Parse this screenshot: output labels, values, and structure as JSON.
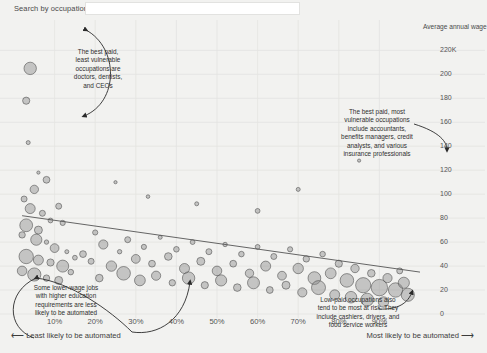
{
  "search": {
    "label": "Search by occupation:",
    "value": "",
    "placeholder": ""
  },
  "chart_data": {
    "type": "scatter",
    "title": "",
    "xlabel": "",
    "ylabel": "Average annual wage",
    "xtick_labels": [
      "10%",
      "20%",
      "30%",
      "40%",
      "50%",
      "60%",
      "70%",
      "80%",
      "90%"
    ],
    "xtick_values": [
      10,
      20,
      30,
      40,
      50,
      60,
      70,
      80,
      90
    ],
    "ytick_labels": [
      "220K",
      "200",
      "180",
      "160",
      "140",
      "120",
      "100",
      "80",
      "60",
      "40",
      "20",
      "0"
    ],
    "ytick_values": [
      220,
      200,
      180,
      160,
      140,
      120,
      100,
      80,
      60,
      40,
      20,
      0
    ],
    "xlim": [
      0,
      100
    ],
    "ylim": [
      0,
      232
    ],
    "grid": true,
    "legend": "none",
    "bubble_size_meaning": "number of workers in occupation",
    "trendline": {
      "present": true,
      "x0": 2,
      "y0": 82,
      "x1": 100,
      "y1": 35,
      "description": "downward sloping fit: higher automation risk associates with lower wage"
    },
    "axis_note_left": "Least likely to be automated",
    "axis_note_right": "Most likely to be automated",
    "points": [
      {
        "x": 4,
        "y": 205,
        "r": 6.2
      },
      {
        "x": 3,
        "y": 178,
        "r": 3.6
      },
      {
        "x": 3.5,
        "y": 143,
        "r": 2.0
      },
      {
        "x": 6,
        "y": 118,
        "r": 1.6
      },
      {
        "x": 2.5,
        "y": 96,
        "r": 3.0
      },
      {
        "x": 5,
        "y": 104,
        "r": 4.2
      },
      {
        "x": 8,
        "y": 112,
        "r": 3.4
      },
      {
        "x": 4,
        "y": 88,
        "r": 5.0
      },
      {
        "x": 7,
        "y": 84,
        "r": 3.0
      },
      {
        "x": 3,
        "y": 74,
        "r": 6.4
      },
      {
        "x": 6,
        "y": 70,
        "r": 4.0
      },
      {
        "x": 9,
        "y": 78,
        "r": 2.4
      },
      {
        "x": 2,
        "y": 66,
        "r": 3.2
      },
      {
        "x": 5.5,
        "y": 62,
        "r": 5.6
      },
      {
        "x": 8,
        "y": 60,
        "r": 2.2
      },
      {
        "x": 11,
        "y": 90,
        "r": 3.0
      },
      {
        "x": 12,
        "y": 76,
        "r": 2.6
      },
      {
        "x": 10,
        "y": 55,
        "r": 4.4
      },
      {
        "x": 13,
        "y": 52,
        "r": 2.0
      },
      {
        "x": 3,
        "y": 48,
        "r": 7.2
      },
      {
        "x": 6,
        "y": 45,
        "r": 5.0
      },
      {
        "x": 9,
        "y": 43,
        "r": 3.6
      },
      {
        "x": 12,
        "y": 40,
        "r": 6.0
      },
      {
        "x": 15,
        "y": 47,
        "r": 2.4
      },
      {
        "x": 2,
        "y": 36,
        "r": 4.8
      },
      {
        "x": 5,
        "y": 33,
        "r": 6.6
      },
      {
        "x": 8,
        "y": 30,
        "r": 3.2
      },
      {
        "x": 11,
        "y": 28,
        "r": 4.0
      },
      {
        "x": 14,
        "y": 35,
        "r": 2.8
      },
      {
        "x": 17,
        "y": 50,
        "r": 3.4
      },
      {
        "x": 20,
        "y": 68,
        "r": 2.6
      },
      {
        "x": 22,
        "y": 58,
        "r": 4.6
      },
      {
        "x": 19,
        "y": 44,
        "r": 3.0
      },
      {
        "x": 24,
        "y": 40,
        "r": 5.2
      },
      {
        "x": 21,
        "y": 30,
        "r": 3.8
      },
      {
        "x": 26,
        "y": 52,
        "r": 2.2
      },
      {
        "x": 28,
        "y": 62,
        "r": 3.0
      },
      {
        "x": 30,
        "y": 46,
        "r": 4.4
      },
      {
        "x": 27,
        "y": 34,
        "r": 6.8
      },
      {
        "x": 32,
        "y": 56,
        "r": 2.6
      },
      {
        "x": 34,
        "y": 42,
        "r": 3.4
      },
      {
        "x": 31,
        "y": 28,
        "r": 5.4
      },
      {
        "x": 36,
        "y": 64,
        "r": 2.0
      },
      {
        "x": 38,
        "y": 48,
        "r": 3.8
      },
      {
        "x": 35,
        "y": 32,
        "r": 4.6
      },
      {
        "x": 40,
        "y": 54,
        "r": 2.8
      },
      {
        "x": 42,
        "y": 38,
        "r": 5.0
      },
      {
        "x": 39,
        "y": 26,
        "r": 3.2
      },
      {
        "x": 44,
        "y": 60,
        "r": 2.4
      },
      {
        "x": 46,
        "y": 44,
        "r": 4.0
      },
      {
        "x": 43,
        "y": 30,
        "r": 6.2
      },
      {
        "x": 48,
        "y": 52,
        "r": 3.0
      },
      {
        "x": 50,
        "y": 36,
        "r": 4.8
      },
      {
        "x": 47,
        "y": 24,
        "r": 3.6
      },
      {
        "x": 52,
        "y": 58,
        "r": 2.2
      },
      {
        "x": 54,
        "y": 42,
        "r": 3.4
      },
      {
        "x": 51,
        "y": 28,
        "r": 5.6
      },
      {
        "x": 56,
        "y": 50,
        "r": 2.8
      },
      {
        "x": 58,
        "y": 34,
        "r": 4.2
      },
      {
        "x": 55,
        "y": 22,
        "r": 3.8
      },
      {
        "x": 60,
        "y": 56,
        "r": 2.4
      },
      {
        "x": 62,
        "y": 40,
        "r": 5.0
      },
      {
        "x": 59,
        "y": 26,
        "r": 6.0
      },
      {
        "x": 64,
        "y": 48,
        "r": 3.0
      },
      {
        "x": 66,
        "y": 32,
        "r": 4.4
      },
      {
        "x": 63,
        "y": 20,
        "r": 3.4
      },
      {
        "x": 68,
        "y": 54,
        "r": 2.6
      },
      {
        "x": 70,
        "y": 38,
        "r": 5.2
      },
      {
        "x": 67,
        "y": 24,
        "r": 4.0
      },
      {
        "x": 72,
        "y": 46,
        "r": 3.2
      },
      {
        "x": 74,
        "y": 30,
        "r": 6.4
      },
      {
        "x": 71,
        "y": 18,
        "r": 4.6
      },
      {
        "x": 76,
        "y": 50,
        "r": 2.8
      },
      {
        "x": 78,
        "y": 34,
        "r": 5.4
      },
      {
        "x": 75,
        "y": 22,
        "r": 7.0
      },
      {
        "x": 80,
        "y": 42,
        "r": 3.6
      },
      {
        "x": 82,
        "y": 28,
        "r": 6.8
      },
      {
        "x": 79,
        "y": 16,
        "r": 5.0
      },
      {
        "x": 84,
        "y": 38,
        "r": 4.2
      },
      {
        "x": 86,
        "y": 24,
        "r": 7.6
      },
      {
        "x": 83,
        "y": 14,
        "r": 5.8
      },
      {
        "x": 88,
        "y": 34,
        "r": 3.8
      },
      {
        "x": 90,
        "y": 22,
        "r": 8.2
      },
      {
        "x": 87,
        "y": 12,
        "r": 6.4
      },
      {
        "x": 92,
        "y": 30,
        "r": 4.6
      },
      {
        "x": 94,
        "y": 20,
        "r": 7.2
      },
      {
        "x": 91,
        "y": 10,
        "r": 5.2
      },
      {
        "x": 96,
        "y": 26,
        "r": 5.6
      },
      {
        "x": 97,
        "y": 16,
        "r": 6.6
      },
      {
        "x": 95,
        "y": 36,
        "r": 3.0
      },
      {
        "x": 85,
        "y": 128,
        "r": 1.6
      },
      {
        "x": 70,
        "y": 104,
        "r": 2.0
      },
      {
        "x": 60,
        "y": 86,
        "r": 2.4
      },
      {
        "x": 45,
        "y": 92,
        "r": 2.0
      },
      {
        "x": 33,
        "y": 98,
        "r": 1.8
      },
      {
        "x": 25,
        "y": 110,
        "r": 1.6
      }
    ]
  },
  "annotations": [
    {
      "id": "best-paid-least-vulnerable",
      "text": "The best paid,\nleast vulnerable\noccupations are\ndoctors, dentists,\nand CEOs"
    },
    {
      "id": "best-paid-most-vulnerable",
      "text": "The best paid, most\nvulnerable occupations\ninclude accountants,\nbenefits managers, credit\nanalysts, and various\ninsurance professionals"
    },
    {
      "id": "lower-wage-higher-education",
      "text": "Some lower-wage jobs\nwith higher education\nrequirements are less\nlikely to be automated"
    },
    {
      "id": "low-paid-most-at-risk",
      "text": "Low-paid occupations also\ntend to be most at risk. They\ninclude cashiers, drivers, and\nfood service workers"
    }
  ],
  "colors": {
    "background": "#f2f2f0",
    "bubble_fill": "#8c8c8c",
    "bubble_stroke": "#4a4a4a",
    "grid": "#e3e3e1",
    "text": "#3a3a3a",
    "trendline": "#555555"
  }
}
